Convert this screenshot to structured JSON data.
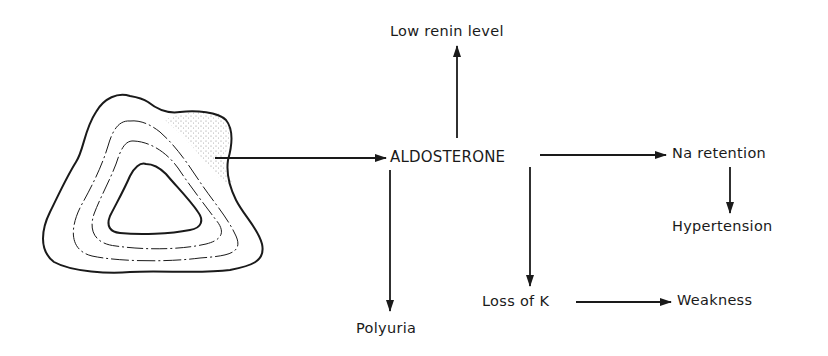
{
  "diagram": {
    "type": "flow",
    "source": {
      "name": "adrenal-gland-tumor",
      "description": "Adrenal gland cross-section with stippled zona glomerulosa tumor"
    },
    "center": {
      "label": "ALDOSTERONE"
    },
    "nodes": {
      "renin": {
        "label": "Low renin level"
      },
      "na": {
        "label": "Na retention"
      },
      "hypertension": {
        "label": "Hypertension"
      },
      "polyuria": {
        "label": "Polyuria"
      },
      "loss_k": {
        "label": "Loss of K"
      },
      "weakness": {
        "label": "Weakness"
      }
    },
    "edges": [
      {
        "from": "adrenal-gland-tumor",
        "to": "ALDOSTERONE"
      },
      {
        "from": "ALDOSTERONE",
        "to": "Low renin level"
      },
      {
        "from": "ALDOSTERONE",
        "to": "Na retention"
      },
      {
        "from": "Na retention",
        "to": "Hypertension"
      },
      {
        "from": "ALDOSTERONE",
        "to": "Polyuria"
      },
      {
        "from": "ALDOSTERONE",
        "to": "Loss of K"
      },
      {
        "from": "Loss of K",
        "to": "Weakness"
      }
    ],
    "colors": {
      "ink": "#1a1a1a",
      "stipple": "#9a9a9a",
      "background": "#ffffff"
    }
  }
}
